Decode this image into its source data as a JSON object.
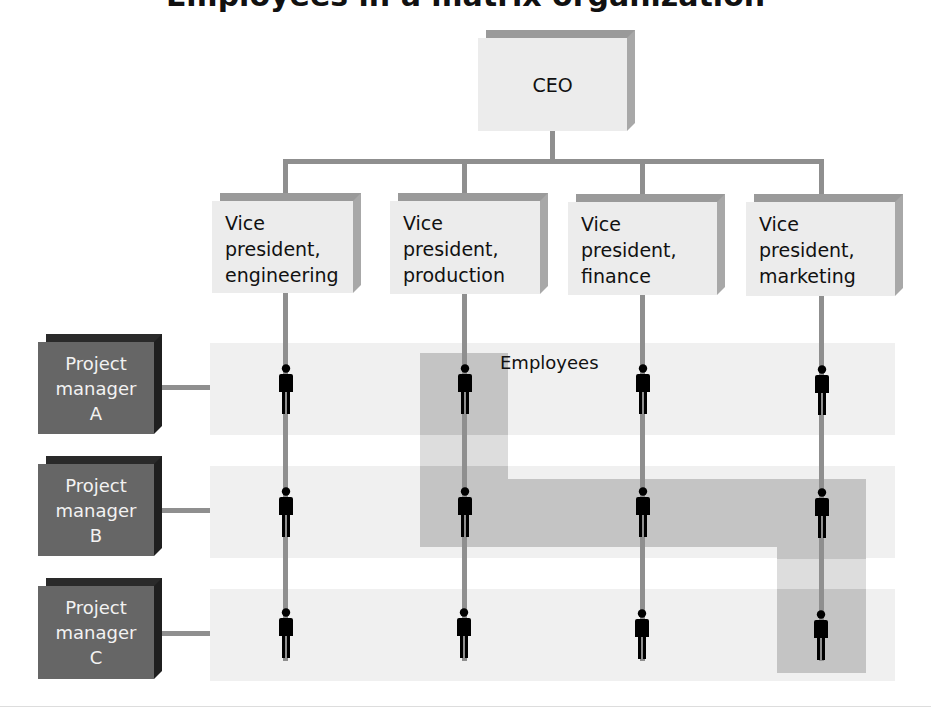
{
  "colors": {
    "connector": "#8f8f8f",
    "box_face": "#ececec",
    "pm_box_face": "#666666",
    "row_band": "#f0f0f0",
    "highlight": "#c4c4c4",
    "person": "#000000"
  },
  "ceo": {
    "label": "CEO"
  },
  "vps": [
    {
      "label": "Vice\npresident,\nengineering"
    },
    {
      "label": "Vice\npresident,\nproduction"
    },
    {
      "label": "Vice\npresident,\nfinance"
    },
    {
      "label": "Vice\npresident,\nmarketing"
    }
  ],
  "project_managers": [
    {
      "label": "Project\nmanager\nA"
    },
    {
      "label": "Project\nmanager\nB"
    },
    {
      "label": "Project\nmanager\nC"
    }
  ],
  "employees_label": "Employees",
  "highlighted_employees": [
    {
      "row": "A",
      "column": "production"
    },
    {
      "row": "B",
      "column": "production"
    },
    {
      "row": "B",
      "column": "finance"
    },
    {
      "row": "B",
      "column": "marketing"
    },
    {
      "row": "C",
      "column": "marketing"
    }
  ]
}
